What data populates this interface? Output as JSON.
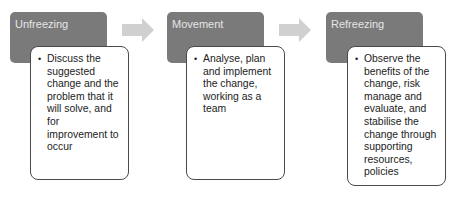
{
  "diagram": {
    "type": "process-flow",
    "colors": {
      "header_fill": "#7a7a7a",
      "header_text": "#e6e6e6",
      "card_border": "#4a4a4a",
      "arrow_fill": "#d0d0d0"
    },
    "stages": [
      {
        "title": "Unfreezing",
        "bullet": "Discuss the suggested change and the problem that it will solve, and for improvement to occur"
      },
      {
        "title": "Movement",
        "bullet": "Analyse, plan and implement the change, working as a team"
      },
      {
        "title": "Refreezing",
        "bullet": "Observe the benefits of the change, risk manage and evaluate, and stabilise the change through supporting resources, policies"
      }
    ]
  }
}
